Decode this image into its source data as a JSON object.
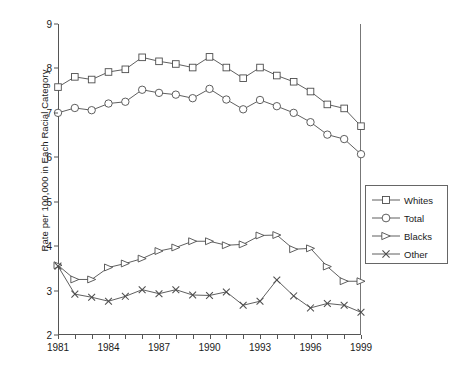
{
  "chart_data": {
    "type": "line",
    "title": "",
    "xlabel": "",
    "ylabel": "Rate per 100,000 in Each Racial Category",
    "xlim": [
      1981,
      1999
    ],
    "ylim": [
      2,
      9
    ],
    "grid": false,
    "legend_position": "right",
    "x": [
      1981,
      1982,
      1983,
      1984,
      1985,
      1986,
      1987,
      1988,
      1989,
      1990,
      1991,
      1992,
      1993,
      1994,
      1995,
      1996,
      1997,
      1998,
      1999
    ],
    "xtick_labels": [
      "1981",
      "1984",
      "1987",
      "1990",
      "1993",
      "1996",
      "1999"
    ],
    "xticks": [
      1981,
      1984,
      1987,
      1990,
      1993,
      1996,
      1999
    ],
    "ytick_labels": [
      "2",
      "3",
      "4",
      "5",
      "6",
      "7",
      "8",
      "9"
    ],
    "yticks": [
      2,
      3,
      4,
      5,
      6,
      7,
      8,
      9
    ],
    "series": [
      {
        "name": "Whites",
        "marker": "square",
        "values": [
          7.58,
          7.81,
          7.75,
          7.92,
          7.98,
          8.25,
          8.16,
          8.1,
          8.02,
          8.26,
          8.02,
          7.78,
          8.02,
          7.84,
          7.7,
          7.48,
          7.19,
          7.1,
          6.7
        ]
      },
      {
        "name": "Total",
        "marker": "circle",
        "values": [
          7.0,
          7.11,
          7.06,
          7.21,
          7.25,
          7.52,
          7.45,
          7.41,
          7.33,
          7.54,
          7.3,
          7.08,
          7.29,
          7.15,
          7.0,
          6.79,
          6.51,
          6.41,
          6.07
        ]
      },
      {
        "name": "Blacks",
        "marker": "triangle",
        "values": [
          3.57,
          3.25,
          3.25,
          3.52,
          3.61,
          3.72,
          3.89,
          3.97,
          4.11,
          4.11,
          4.02,
          4.04,
          4.24,
          4.25,
          3.93,
          3.95,
          3.54,
          3.21,
          3.21
        ]
      },
      {
        "name": "Other",
        "marker": "cross",
        "values": [
          3.55,
          2.92,
          2.85,
          2.76,
          2.87,
          3.02,
          2.93,
          3.02,
          2.9,
          2.89,
          2.97,
          2.67,
          2.76,
          3.24,
          2.88,
          2.61,
          2.71,
          2.67,
          2.51
        ]
      }
    ]
  },
  "legend": {
    "items": [
      {
        "label": "Whites",
        "marker": "square"
      },
      {
        "label": "Total",
        "marker": "circle"
      },
      {
        "label": "Blacks",
        "marker": "triangle"
      },
      {
        "label": "Other",
        "marker": "cross"
      }
    ]
  },
  "colors": {
    "line": "#4d4d4d",
    "axis": "#555555",
    "text": "#1a1a1a",
    "background": "#ffffff"
  }
}
